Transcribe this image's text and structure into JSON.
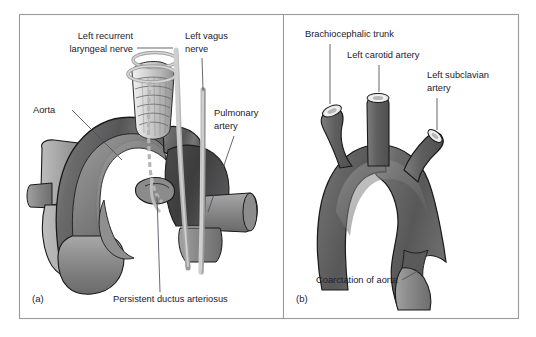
{
  "figure": {
    "panels": [
      {
        "letter": "(a)",
        "name": "persistent-ductus-arteriosus",
        "labels": [
          {
            "id": "left-recurrent-laryngeal-nerve",
            "text_line1": "Left recurrent",
            "text_line2": "laryngeal nerve"
          },
          {
            "id": "left-vagus-nerve",
            "text_line1": "Left vagus",
            "text_line2": "nerve"
          },
          {
            "id": "aorta",
            "text_line1": "Aorta",
            "text_line2": ""
          },
          {
            "id": "pulmonary-artery",
            "text_line1": "Pulmonary",
            "text_line2": "artery"
          },
          {
            "id": "persistent-ductus-arteriosus",
            "text_line1": "Persistent ductus arteriosus",
            "text_line2": ""
          }
        ]
      },
      {
        "letter": "(b)",
        "name": "coarctation-of-aorta",
        "labels": [
          {
            "id": "brachiocephalic-trunk",
            "text_line1": "Brachiocephalic trunk",
            "text_line2": ""
          },
          {
            "id": "left-carotid-artery",
            "text_line1": "Left carotid artery",
            "text_line2": ""
          },
          {
            "id": "left-subclavian-artery",
            "text_line1": "Left subclavian",
            "text_line2": "artery"
          },
          {
            "id": "coarctation-of-aorta",
            "text_line1": "Coarctation of aorta",
            "text_line2": ""
          }
        ]
      }
    ],
    "colors": {
      "text": "#1d2030",
      "leader": "#4a4d5c",
      "frame": "#9a9a9a",
      "vessel_dark": "#4a4a4a",
      "vessel_mid": "#6f6f6f",
      "vessel_light": "#9b9b9b",
      "vessel_pale": "#b9b9b9",
      "nerve": "#b5b5b5",
      "outline": "#1a1a1a",
      "background": "#ffffff"
    }
  }
}
